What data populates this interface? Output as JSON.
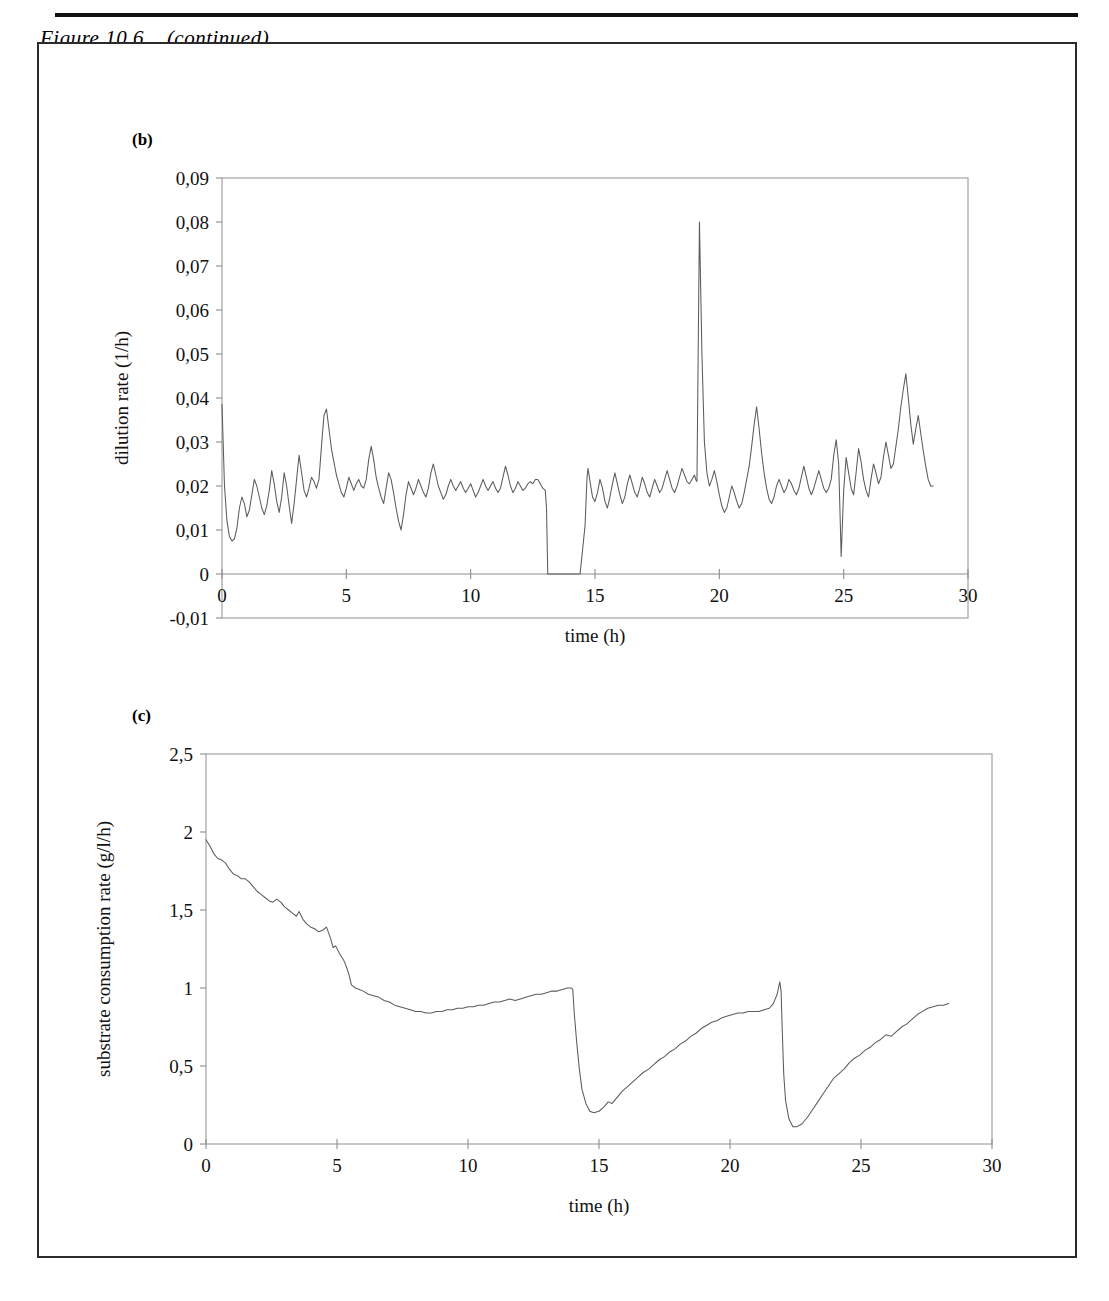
{
  "figure": {
    "caption": "Figure 10.6    (continued)",
    "panel_b_label": "(b)",
    "panel_c_label": "(c)"
  },
  "chart_data": [
    {
      "id": "panel-b",
      "type": "line",
      "title": "",
      "xlabel": "time (h)",
      "ylabel": "dilution rate (1/h)",
      "xlim": [
        0,
        30
      ],
      "ylim": [
        -0.01,
        0.09
      ],
      "xticks": [
        0,
        5,
        10,
        15,
        20,
        25,
        30
      ],
      "xtick_labels": [
        "0",
        "5",
        "10",
        "15",
        "20",
        "25",
        "30"
      ],
      "yticks": [
        -0.01,
        0,
        0.01,
        0.02,
        0.03,
        0.04,
        0.05,
        0.06,
        0.07,
        0.08,
        0.09
      ],
      "ytick_labels": [
        "-0,01",
        "0",
        "0,01",
        "0,02",
        "0,03",
        "0,04",
        "0,05",
        "0,06",
        "0,07",
        "0,08",
        "0,09"
      ],
      "grid": false,
      "legend": "none",
      "x": [
        0.0,
        0.1,
        0.2,
        0.3,
        0.4,
        0.5,
        0.6,
        0.7,
        0.8,
        0.9,
        1.0,
        1.1,
        1.2,
        1.3,
        1.4,
        1.5,
        1.6,
        1.7,
        1.8,
        1.9,
        2.0,
        2.1,
        2.2,
        2.3,
        2.4,
        2.5,
        2.6,
        2.7,
        2.8,
        2.9,
        3.0,
        3.1,
        3.2,
        3.3,
        3.4,
        3.5,
        3.6,
        3.7,
        3.8,
        3.9,
        4.0,
        4.1,
        4.2,
        4.3,
        4.4,
        4.5,
        4.6,
        4.7,
        4.8,
        4.9,
        5.0,
        5.1,
        5.2,
        5.3,
        5.4,
        5.5,
        5.6,
        5.7,
        5.8,
        5.9,
        6.0,
        6.1,
        6.2,
        6.3,
        6.4,
        6.5,
        6.6,
        6.7,
        6.8,
        6.9,
        7.0,
        7.1,
        7.2,
        7.3,
        7.4,
        7.5,
        7.6,
        7.7,
        7.8,
        7.9,
        8.0,
        8.1,
        8.2,
        8.3,
        8.4,
        8.5,
        8.6,
        8.7,
        8.8,
        8.9,
        9.0,
        9.1,
        9.2,
        9.3,
        9.4,
        9.5,
        9.6,
        9.7,
        9.8,
        9.9,
        10.0,
        10.1,
        10.2,
        10.3,
        10.4,
        10.5,
        10.6,
        10.7,
        10.8,
        10.9,
        11.0,
        11.1,
        11.2,
        11.3,
        11.4,
        11.5,
        11.6,
        11.7,
        11.8,
        11.9,
        12.0,
        12.1,
        12.2,
        12.3,
        12.4,
        12.5,
        12.6,
        12.7,
        12.8,
        12.9,
        13.0,
        13.05,
        13.1,
        13.2,
        13.3,
        13.6,
        14.0,
        14.4,
        14.6,
        14.68,
        14.72,
        14.8,
        14.9,
        15.0,
        15.1,
        15.2,
        15.3,
        15.4,
        15.5,
        15.6,
        15.7,
        15.8,
        15.9,
        16.0,
        16.1,
        16.2,
        16.3,
        16.4,
        16.5,
        16.6,
        16.7,
        16.8,
        16.9,
        17.0,
        17.1,
        17.2,
        17.3,
        17.4,
        17.5,
        17.6,
        17.7,
        17.8,
        17.9,
        18.0,
        18.1,
        18.2,
        18.3,
        18.4,
        18.5,
        18.6,
        18.7,
        18.8,
        18.9,
        19.0,
        19.05,
        19.1,
        19.2,
        19.3,
        19.4,
        19.5,
        19.6,
        19.7,
        19.8,
        19.9,
        20.0,
        20.1,
        20.2,
        20.3,
        20.4,
        20.5,
        20.6,
        20.7,
        20.8,
        20.9,
        21.0,
        21.1,
        21.2,
        21.3,
        21.4,
        21.5,
        21.6,
        21.7,
        21.8,
        21.9,
        22.0,
        22.1,
        22.2,
        22.3,
        22.4,
        22.5,
        22.6,
        22.7,
        22.8,
        22.9,
        23.0,
        23.1,
        23.2,
        23.3,
        23.4,
        23.5,
        23.6,
        23.7,
        23.8,
        23.9,
        24.0,
        24.1,
        24.2,
        24.3,
        24.4,
        24.5,
        24.6,
        24.7,
        24.8,
        24.9,
        25.0,
        25.1,
        25.2,
        25.3,
        25.4,
        25.5,
        25.6,
        25.7,
        25.8,
        25.9,
        26.0,
        26.1,
        26.2,
        26.3,
        26.4,
        26.5,
        26.6,
        26.7,
        26.8,
        26.9,
        27.0,
        27.1,
        27.2,
        27.3,
        27.4,
        27.5,
        27.6,
        27.7,
        27.8,
        27.9,
        28.0,
        28.1,
        28.2,
        28.3,
        28.4,
        28.5,
        28.6,
        28.7,
        28.8,
        28.9
      ],
      "y": [
        0.0385,
        0.02,
        0.012,
        0.0085,
        0.0075,
        0.008,
        0.0105,
        0.015,
        0.0175,
        0.016,
        0.013,
        0.0145,
        0.018,
        0.0215,
        0.02,
        0.0175,
        0.015,
        0.0135,
        0.0155,
        0.019,
        0.0235,
        0.0205,
        0.0165,
        0.014,
        0.0175,
        0.023,
        0.02,
        0.0155,
        0.0115,
        0.016,
        0.0215,
        0.027,
        0.023,
        0.019,
        0.0175,
        0.0195,
        0.022,
        0.021,
        0.0195,
        0.0215,
        0.029,
        0.036,
        0.0375,
        0.033,
        0.0285,
        0.0255,
        0.0225,
        0.0205,
        0.0185,
        0.0175,
        0.0195,
        0.022,
        0.0205,
        0.019,
        0.0205,
        0.0215,
        0.02,
        0.0195,
        0.0215,
        0.026,
        0.029,
        0.026,
        0.022,
        0.0195,
        0.0175,
        0.016,
        0.0195,
        0.023,
        0.0215,
        0.0185,
        0.015,
        0.012,
        0.01,
        0.0135,
        0.018,
        0.021,
        0.0195,
        0.018,
        0.0195,
        0.0215,
        0.02,
        0.0185,
        0.0175,
        0.0195,
        0.023,
        0.025,
        0.0225,
        0.02,
        0.0185,
        0.017,
        0.018,
        0.02,
        0.0215,
        0.02,
        0.019,
        0.02,
        0.021,
        0.0195,
        0.0185,
        0.0195,
        0.0205,
        0.019,
        0.0175,
        0.0185,
        0.02,
        0.0215,
        0.02,
        0.019,
        0.02,
        0.021,
        0.0195,
        0.0185,
        0.0195,
        0.022,
        0.0245,
        0.0225,
        0.02,
        0.0185,
        0.0195,
        0.021,
        0.02,
        0.019,
        0.0195,
        0.0205,
        0.021,
        0.0205,
        0.0215,
        0.0215,
        0.0205,
        0.0195,
        0.019,
        0.015,
        0.0,
        0.0,
        0.0,
        0.0,
        0.0,
        0.0,
        0.011,
        0.022,
        0.024,
        0.021,
        0.0175,
        0.0165,
        0.0185,
        0.0215,
        0.0195,
        0.0165,
        0.015,
        0.0175,
        0.0205,
        0.023,
        0.0205,
        0.018,
        0.016,
        0.0175,
        0.0205,
        0.0225,
        0.0205,
        0.0185,
        0.0175,
        0.0195,
        0.022,
        0.0205,
        0.0185,
        0.0175,
        0.0195,
        0.0215,
        0.02,
        0.0185,
        0.0195,
        0.0215,
        0.0235,
        0.0215,
        0.0195,
        0.0185,
        0.02,
        0.022,
        0.024,
        0.0225,
        0.021,
        0.0205,
        0.0215,
        0.0225,
        0.0215,
        0.021,
        0.08,
        0.05,
        0.03,
        0.023,
        0.02,
        0.0215,
        0.0235,
        0.021,
        0.018,
        0.0155,
        0.014,
        0.015,
        0.0175,
        0.02,
        0.0185,
        0.0165,
        0.015,
        0.016,
        0.0185,
        0.0215,
        0.0245,
        0.029,
        0.034,
        0.038,
        0.033,
        0.0275,
        0.023,
        0.0195,
        0.017,
        0.016,
        0.0175,
        0.02,
        0.0215,
        0.02,
        0.0185,
        0.0195,
        0.0215,
        0.0205,
        0.019,
        0.018,
        0.0195,
        0.022,
        0.0245,
        0.022,
        0.0195,
        0.018,
        0.0195,
        0.0215,
        0.0235,
        0.0215,
        0.0195,
        0.0185,
        0.0195,
        0.0215,
        0.027,
        0.0305,
        0.025,
        0.004,
        0.019,
        0.0265,
        0.023,
        0.0195,
        0.018,
        0.023,
        0.0285,
        0.0255,
        0.0215,
        0.019,
        0.0175,
        0.0215,
        0.025,
        0.023,
        0.0205,
        0.022,
        0.0265,
        0.03,
        0.027,
        0.024,
        0.025,
        0.029,
        0.033,
        0.038,
        0.042,
        0.0455,
        0.04,
        0.034,
        0.0295,
        0.033,
        0.036,
        0.032,
        0.028,
        0.0245,
        0.0215,
        0.02,
        0.02
      ]
    },
    {
      "id": "panel-c",
      "type": "line",
      "title": "",
      "xlabel": "time (h)",
      "ylabel": "substrate consumption rate (g/l/h)",
      "xlim": [
        0,
        30
      ],
      "ylim": [
        0,
        2.5
      ],
      "xticks": [
        0,
        5,
        10,
        15,
        20,
        25,
        30
      ],
      "xtick_labels": [
        "0",
        "5",
        "10",
        "15",
        "20",
        "25",
        "30"
      ],
      "yticks": [
        0,
        0.5,
        1,
        1.5,
        2,
        2.5
      ],
      "ytick_labels": [
        "0",
        "0,5",
        "1",
        "1,5",
        "2",
        "2,5"
      ],
      "grid": false,
      "legend": "none",
      "x": [
        0.0,
        0.15,
        0.3,
        0.45,
        0.6,
        0.75,
        0.9,
        1.05,
        1.2,
        1.35,
        1.5,
        1.65,
        1.8,
        1.95,
        2.1,
        2.25,
        2.4,
        2.55,
        2.7,
        2.85,
        3.0,
        3.15,
        3.3,
        3.45,
        3.55,
        3.7,
        3.85,
        4.0,
        4.15,
        4.3,
        4.45,
        4.6,
        4.75,
        4.85,
        4.95,
        5.1,
        5.25,
        5.35,
        5.45,
        5.55,
        5.7,
        5.85,
        6.0,
        6.2,
        6.4,
        6.6,
        6.8,
        7.0,
        7.2,
        7.4,
        7.6,
        7.8,
        8.0,
        8.2,
        8.4,
        8.6,
        8.8,
        9.0,
        9.2,
        9.4,
        9.6,
        9.8,
        10.0,
        10.2,
        10.4,
        10.6,
        10.8,
        11.0,
        11.2,
        11.4,
        11.6,
        11.8,
        12.0,
        12.2,
        12.4,
        12.6,
        12.8,
        13.0,
        13.2,
        13.4,
        13.6,
        13.8,
        13.95,
        14.0,
        14.05,
        14.15,
        14.25,
        14.35,
        14.5,
        14.65,
        14.8,
        15.0,
        15.2,
        15.35,
        15.5,
        15.7,
        15.9,
        16.1,
        16.3,
        16.5,
        16.7,
        16.9,
        17.1,
        17.3,
        17.5,
        17.7,
        17.9,
        18.1,
        18.3,
        18.5,
        18.7,
        18.9,
        19.1,
        19.3,
        19.5,
        19.7,
        19.9,
        20.1,
        20.3,
        20.5,
        20.7,
        20.9,
        21.1,
        21.3,
        21.5,
        21.65,
        21.8,
        21.9,
        21.95,
        22.0,
        22.05,
        22.12,
        22.25,
        22.4,
        22.55,
        22.75,
        22.95,
        23.15,
        23.35,
        23.55,
        23.75,
        23.95,
        24.15,
        24.35,
        24.55,
        24.75,
        24.95,
        25.15,
        25.35,
        25.55,
        25.75,
        25.95,
        26.15,
        26.35,
        26.55,
        26.75,
        26.95,
        27.15,
        27.35,
        27.55,
        27.75,
        27.95,
        28.15,
        28.35,
        28.55,
        28.75,
        28.95
      ],
      "y": [
        1.95,
        1.91,
        1.86,
        1.83,
        1.82,
        1.8,
        1.76,
        1.73,
        1.72,
        1.7,
        1.7,
        1.68,
        1.65,
        1.62,
        1.6,
        1.58,
        1.56,
        1.55,
        1.57,
        1.55,
        1.52,
        1.5,
        1.48,
        1.46,
        1.49,
        1.44,
        1.41,
        1.39,
        1.38,
        1.36,
        1.37,
        1.39,
        1.32,
        1.26,
        1.27,
        1.22,
        1.18,
        1.14,
        1.09,
        1.02,
        1.0,
        0.99,
        0.98,
        0.96,
        0.95,
        0.94,
        0.92,
        0.91,
        0.89,
        0.88,
        0.87,
        0.86,
        0.85,
        0.85,
        0.84,
        0.84,
        0.85,
        0.85,
        0.86,
        0.86,
        0.87,
        0.87,
        0.88,
        0.88,
        0.89,
        0.89,
        0.9,
        0.91,
        0.91,
        0.92,
        0.93,
        0.92,
        0.93,
        0.94,
        0.95,
        0.96,
        0.96,
        0.97,
        0.98,
        0.98,
        0.99,
        1.0,
        1.0,
        0.99,
        0.85,
        0.65,
        0.48,
        0.35,
        0.26,
        0.21,
        0.2,
        0.21,
        0.24,
        0.27,
        0.26,
        0.3,
        0.34,
        0.37,
        0.4,
        0.43,
        0.46,
        0.48,
        0.51,
        0.54,
        0.56,
        0.59,
        0.61,
        0.64,
        0.66,
        0.69,
        0.71,
        0.74,
        0.76,
        0.78,
        0.79,
        0.81,
        0.82,
        0.83,
        0.84,
        0.84,
        0.85,
        0.85,
        0.85,
        0.86,
        0.87,
        0.9,
        0.96,
        1.04,
        0.98,
        0.7,
        0.45,
        0.28,
        0.16,
        0.11,
        0.11,
        0.13,
        0.17,
        0.22,
        0.27,
        0.32,
        0.37,
        0.42,
        0.45,
        0.48,
        0.52,
        0.55,
        0.57,
        0.6,
        0.62,
        0.65,
        0.67,
        0.7,
        0.69,
        0.72,
        0.75,
        0.77,
        0.8,
        0.83,
        0.85,
        0.87,
        0.88,
        0.89,
        0.89,
        0.9
      ]
    }
  ]
}
